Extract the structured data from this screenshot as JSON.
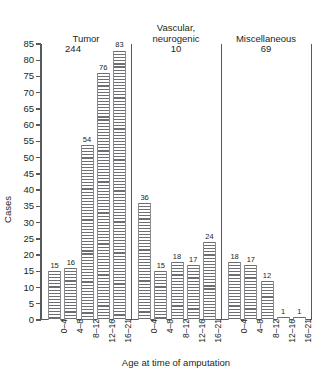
{
  "chart_data": {
    "type": "bar",
    "title": "",
    "xlabel": "Age at time of amputation",
    "ylabel": "Cases",
    "ylim": [
      0,
      85
    ],
    "yticks": [
      0,
      5,
      10,
      15,
      20,
      25,
      30,
      35,
      40,
      45,
      50,
      55,
      60,
      65,
      70,
      75,
      80,
      85
    ],
    "grid": false,
    "legend": "none",
    "categories": [
      "0–4",
      "4–8",
      "8–12",
      "12–16",
      "16–21"
    ],
    "groups": [
      {
        "name": "Tumor",
        "total": "244",
        "values": [
          15,
          16,
          54,
          76,
          83
        ],
        "value_labels": [
          "15",
          "16",
          "54",
          "76",
          "83"
        ]
      },
      {
        "name": "Vascular, neurogenic",
        "name_line1": "Vascular,",
        "name_line2": "neurogenic",
        "total": "10",
        "values": [
          36,
          15,
          18,
          17,
          24
        ],
        "value_labels": [
          "36",
          "15",
          "18",
          "17",
          "24"
        ]
      },
      {
        "name": "Miscellaneous",
        "total": "69",
        "values": [
          18,
          17,
          12,
          1,
          1
        ],
        "value_labels": [
          "18",
          "17",
          "12",
          "1",
          "1"
        ]
      }
    ],
    "colors": {
      "bar_hatch": "#6d6e71",
      "bar_fill": "#ffffff",
      "axis": "#58595b",
      "text": "#231f20"
    }
  }
}
